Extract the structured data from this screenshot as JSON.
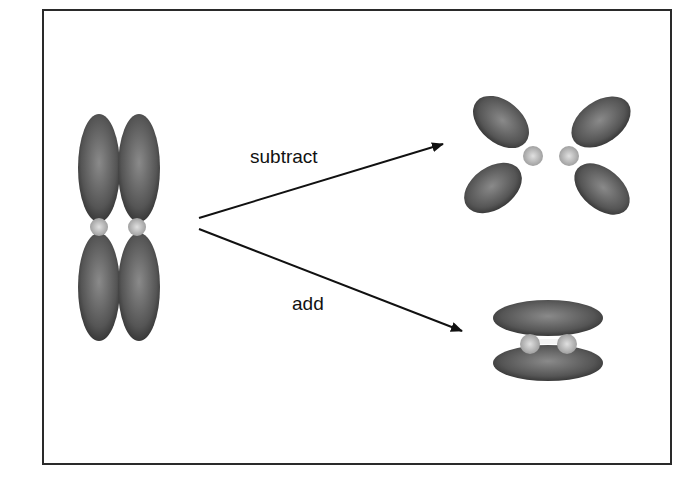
{
  "diagram": {
    "labels": {
      "top_arrow": "subtract",
      "bottom_arrow": "add"
    },
    "colors": {
      "lobe": "#4a4a4a",
      "lobe_highlight": "#8a8a8a",
      "nucleus": "#c8c8c8",
      "line": "#111111",
      "frame": "#2a2a2a"
    }
  }
}
